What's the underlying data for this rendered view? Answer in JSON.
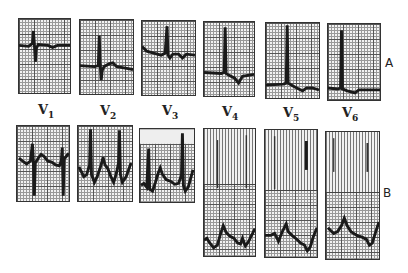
{
  "figure": {
    "row_labels": {
      "a": "A",
      "b": "B"
    },
    "leads": [
      {
        "main": "V",
        "sub": "1"
      },
      {
        "main": "V",
        "sub": "2"
      },
      {
        "main": "V",
        "sub": "3"
      },
      {
        "main": "V",
        "sub": "4"
      },
      {
        "main": "V",
        "sub": "5"
      },
      {
        "main": "V",
        "sub": "6"
      }
    ],
    "trace_color": "#1a1a1a",
    "grid_color": "#555555"
  }
}
